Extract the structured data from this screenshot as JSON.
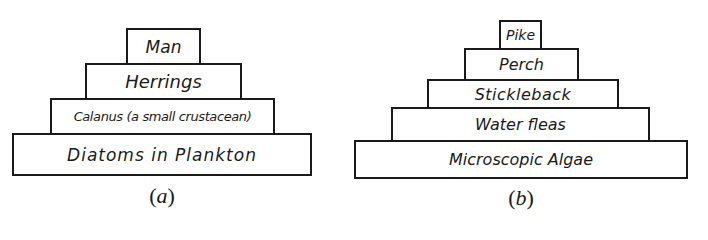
{
  "pyramid_a": {
    "caption_open": "(",
    "caption_letter": "a",
    "caption_close": ")",
    "levels": [
      {
        "label": "Man"
      },
      {
        "label": "Herrings"
      },
      {
        "label": "Calanus (a small crustacean)"
      },
      {
        "label": "Diatoms in Plankton"
      }
    ]
  },
  "pyramid_b": {
    "caption_open": "(",
    "caption_letter": "b",
    "caption_close": ")",
    "levels": [
      {
        "label": "Pike"
      },
      {
        "label": "Perch"
      },
      {
        "label": "Stickleback"
      },
      {
        "label": "Water fleas"
      },
      {
        "label": "Microscopic Algae"
      }
    ]
  }
}
